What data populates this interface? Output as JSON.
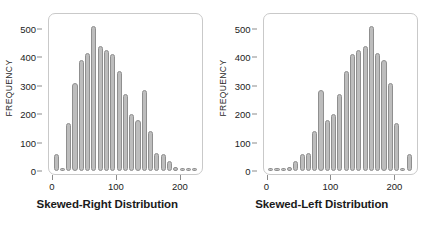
{
  "figure": {
    "background": "#ffffff",
    "bar_fill": "#bdbdbd",
    "bar_edge": "#8f8f8f",
    "frame_color": "#c9c9c9",
    "text_color": "#1c1c1c"
  },
  "chart_data": [
    {
      "type": "bar",
      "title": "Skewed-Right Distribution",
      "xlabel": "",
      "ylabel": "FREQUENCY",
      "xlim": [
        0,
        230
      ],
      "ylim": [
        0,
        520
      ],
      "xticks": [
        0,
        100,
        200
      ],
      "xtick_labels": [
        "0",
        "100",
        "200"
      ],
      "yticks": [
        0,
        100,
        200,
        300,
        400,
        500
      ],
      "ytick_labels": [
        "0",
        "100",
        "200",
        "300",
        "400",
        "500"
      ],
      "grid": false,
      "legend": "none",
      "bin_width": 10,
      "categories": [
        5,
        15,
        25,
        35,
        45,
        55,
        65,
        75,
        85,
        95,
        105,
        115,
        125,
        135,
        145,
        155,
        165,
        175,
        185,
        195,
        205,
        215,
        225
      ],
      "values": [
        60,
        0,
        170,
        310,
        390,
        415,
        510,
        440,
        425,
        410,
        350,
        270,
        200,
        180,
        285,
        140,
        65,
        60,
        35,
        15,
        10,
        10,
        10
      ]
    },
    {
      "type": "bar",
      "title": "Skewed-Left Distribution",
      "xlabel": "",
      "ylabel": "FREQUENCY",
      "xlim": [
        0,
        230
      ],
      "ylim": [
        0,
        520
      ],
      "xticks": [
        0,
        100,
        200
      ],
      "xtick_labels": [
        "0",
        "100",
        "200"
      ],
      "yticks": [
        0,
        100,
        200,
        300,
        400,
        500
      ],
      "ytick_labels": [
        "0",
        "100",
        "200",
        "300",
        "400",
        "500"
      ],
      "grid": false,
      "legend": "none",
      "bin_width": 10,
      "categories": [
        5,
        15,
        25,
        35,
        45,
        55,
        65,
        75,
        85,
        95,
        105,
        115,
        125,
        135,
        145,
        155,
        165,
        175,
        185,
        195,
        205,
        215,
        225
      ],
      "values": [
        10,
        10,
        10,
        15,
        35,
        60,
        65,
        140,
        285,
        180,
        200,
        270,
        350,
        410,
        425,
        440,
        510,
        415,
        390,
        310,
        170,
        0,
        60
      ]
    }
  ]
}
